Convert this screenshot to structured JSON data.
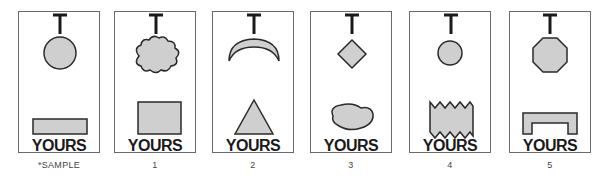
{
  "cards": [
    {
      "caption": "*SAMPLE",
      "letter": "T",
      "label": "YOURS",
      "top_shape": "circle",
      "bottom_shape": "wide-rectangle"
    },
    {
      "caption": "1",
      "letter": "T",
      "label": "YOURS",
      "top_shape": "cloud",
      "bottom_shape": "rectangle"
    },
    {
      "caption": "2",
      "letter": "T",
      "label": "YOURS",
      "top_shape": "crescent",
      "bottom_shape": "triangle"
    },
    {
      "caption": "3",
      "letter": "T",
      "label": "YOURS",
      "top_shape": "diamond",
      "bottom_shape": "blob"
    },
    {
      "caption": "4",
      "letter": "T",
      "label": "YOURS",
      "top_shape": "small-circle",
      "bottom_shape": "zigzag-rectangle"
    },
    {
      "caption": "5",
      "letter": "T",
      "label": "YOURS",
      "top_shape": "octagon",
      "bottom_shape": "bracket"
    }
  ],
  "colors": {
    "shape_fill": "#cfcfcf",
    "shape_stroke": "#2a2a2a",
    "border": "#6a6a6a"
  }
}
